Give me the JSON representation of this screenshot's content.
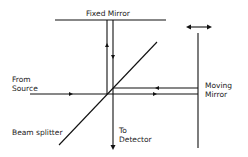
{
  "diagram": {
    "labels": {
      "fixed_mirror": "Fixed Mirror",
      "from_source_1": "From",
      "from_source_2": "Source",
      "moving_mirror_1": "Moving",
      "moving_mirror_2": "Mirror",
      "beam_splitter": "Beam splitter",
      "to_detector_1": "To",
      "to_detector_2": "Detector"
    },
    "colors": {
      "line": "#111111",
      "text": "#222222",
      "background": "#ffffff"
    }
  }
}
